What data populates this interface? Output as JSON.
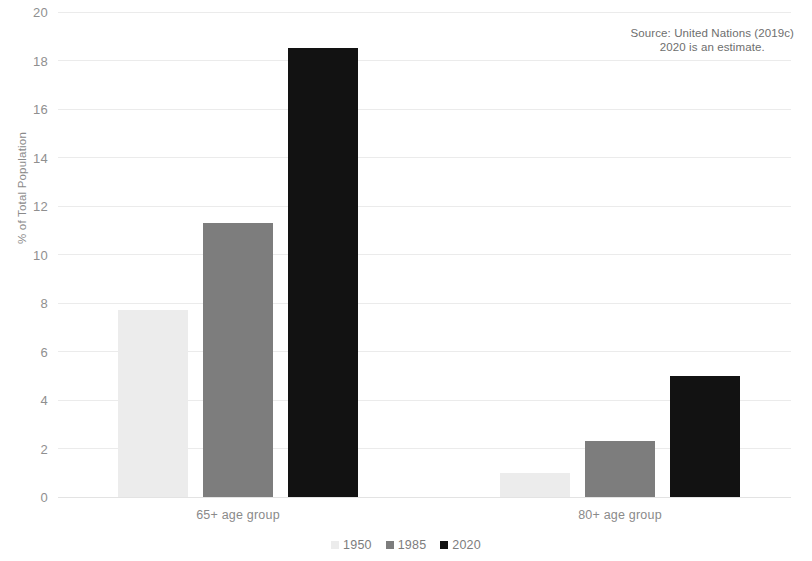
{
  "chart_data": {
    "type": "bar",
    "title": "",
    "subtitle": "",
    "xlabel": "",
    "ylabel": "% of Total Population",
    "categories": [
      "65+ age group",
      "80+ age group"
    ],
    "series": [
      {
        "name": "1950",
        "color": "#ececec",
        "values": [
          7.7,
          1.0
        ]
      },
      {
        "name": "1985",
        "color": "#7d7d7d",
        "values": [
          11.3,
          2.3
        ]
      },
      {
        "name": "2020",
        "color": "#121212",
        "values": [
          18.5,
          5.0
        ]
      }
    ],
    "ylim": [
      0,
      20
    ],
    "yticks": [
      0,
      2,
      4,
      6,
      8,
      10,
      12,
      14,
      16,
      18,
      20
    ],
    "ytick_labels": [
      "0",
      "2",
      "4",
      "6",
      "8",
      "10",
      "12",
      "14",
      "16",
      "18",
      "20"
    ],
    "grid": true,
    "legend_position": "bottom",
    "annotations": [
      "Source: United Nations (2019c)",
      "2020 is an estimate."
    ]
  },
  "source_note": {
    "line1": "Source: United Nations (2019c)",
    "line2": "2020 is an estimate."
  },
  "axes": {
    "y_axis_title": "% of Total Population"
  },
  "colors": {
    "series_1950": "#ececec",
    "series_1985": "#7d7d7d",
    "series_2020": "#121212",
    "gridline": "#ebebeb",
    "tick_text": "#8f8f8f"
  }
}
